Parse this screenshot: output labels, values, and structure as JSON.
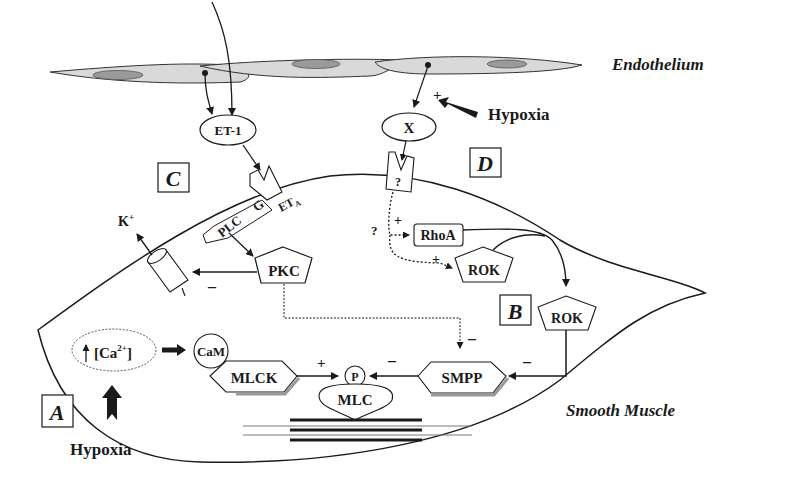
{
  "labels": {
    "endothelium": "Endothelium",
    "smooth_muscle": "Smooth Muscle",
    "hypoxia_top": "Hypoxia",
    "hypoxia_bottom": "Hypoxia"
  },
  "panels": {
    "a": "A",
    "b": "B",
    "c": "C",
    "d": "D"
  },
  "nodes": {
    "et1": "ET-1",
    "x": "X",
    "receptor_unknown": "?",
    "eta": "ET",
    "eta_sub": "A",
    "plc": "PLC",
    "g": "G",
    "pkc": "PKC",
    "rhoa": "RhoA",
    "rok_inner": "ROK",
    "rok_b": "ROK",
    "k_ion": "K",
    "k_sup": "+",
    "calcium": "[Ca",
    "calcium_sup": "2+",
    "calcium_close": "]",
    "cam": "CaM",
    "mlck": "MLCK",
    "p": "P",
    "mlc": "MLC",
    "smpp": "SMPP"
  },
  "signs": {
    "hypoxia_x": "+",
    "rhoa_plus": "+",
    "rok_plus": "+",
    "unknown_path": "?",
    "pkc_k_minus": "–",
    "mlck_plus": "+",
    "smpp_minus": "–",
    "pkc_smpp_minus": "–",
    "rok_smpp_minus": "–"
  }
}
